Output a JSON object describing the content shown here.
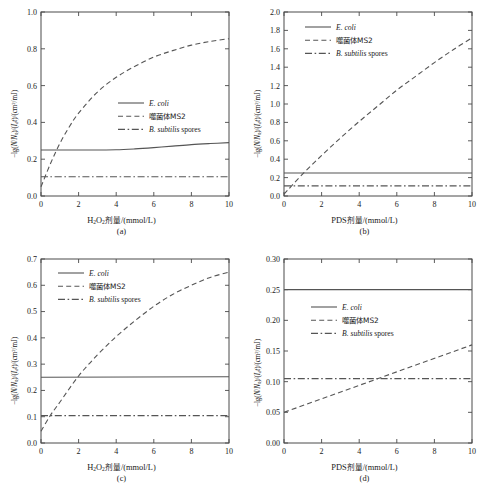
{
  "figure": {
    "ylabel_prefix": "−lg(",
    "series_names": {
      "ecoli": "E. coli",
      "ms2": "噬菌体MS2",
      "spores_italic": "B. subtilis",
      "spores_rest": " spores"
    }
  },
  "chart_data": [
    {
      "id": "a",
      "type": "line",
      "panel_label": "(a)",
      "title": "",
      "xlabel_cjk": "剂量",
      "xlabel_full": "H2O2剂量/(mmol/L)",
      "ylabel": "−lg(N/N0)/(Idt)/(cm2/mJ)",
      "xlim": [
        0,
        10
      ],
      "ylim": [
        0,
        1.0
      ],
      "xticks": [
        0,
        2,
        4,
        6,
        8,
        10
      ],
      "yticks": [
        0.0,
        0.2,
        0.4,
        0.6,
        0.8,
        1.0
      ],
      "ytick_labels": [
        "0.0",
        "0.2",
        "0.4",
        "0.6",
        "0.8",
        "1.0"
      ],
      "xtick_labels": [
        "0",
        "2",
        "4",
        "6",
        "8",
        "10"
      ],
      "grid": false,
      "legend_position": "center-right",
      "series": [
        {
          "name": "E. coli",
          "style": "solid",
          "x": [
            0,
            1,
            2,
            3,
            4,
            5,
            6,
            7,
            8,
            9,
            10
          ],
          "values": [
            0.25,
            0.25,
            0.25,
            0.25,
            0.251,
            0.256,
            0.263,
            0.271,
            0.279,
            0.285,
            0.29
          ]
        },
        {
          "name": "噬菌体MS2",
          "style": "dashed",
          "x": [
            0,
            0.5,
            1,
            1.5,
            2,
            3,
            4,
            5,
            6,
            7,
            8,
            9,
            10
          ],
          "values": [
            0.05,
            0.175,
            0.285,
            0.375,
            0.45,
            0.565,
            0.645,
            0.705,
            0.755,
            0.79,
            0.82,
            0.84,
            0.855
          ]
        },
        {
          "name": "B. subtilis spores",
          "style": "dashdot",
          "x": [
            0,
            2,
            4,
            6,
            8,
            10
          ],
          "values": [
            0.105,
            0.105,
            0.105,
            0.105,
            0.105,
            0.105
          ]
        }
      ]
    },
    {
      "id": "b",
      "type": "line",
      "panel_label": "(b)",
      "title": "",
      "xlabel_full": "PDS剂量/(mmol/L)",
      "ylabel": "−lg(N/N0)/(Idt)/(cm2/mJ)",
      "xlim": [
        0,
        10
      ],
      "ylim": [
        0,
        2.0
      ],
      "xticks": [
        0,
        2,
        4,
        6,
        8,
        10
      ],
      "yticks": [
        0.0,
        0.2,
        0.4,
        0.6,
        0.8,
        1.0,
        1.2,
        1.4,
        1.6,
        1.8,
        2.0
      ],
      "ytick_labels": [
        "0.0",
        "0.2",
        "0.4",
        "0.6",
        "0.8",
        "1.0",
        "1.2",
        "1.4",
        "1.6",
        "1.8",
        "2.0"
      ],
      "xtick_labels": [
        "0",
        "2",
        "4",
        "6",
        "8",
        "10"
      ],
      "grid": false,
      "legend_position": "top-left",
      "series": [
        {
          "name": "E. coli",
          "style": "solid",
          "x": [
            0,
            10
          ],
          "values": [
            0.25,
            0.25
          ]
        },
        {
          "name": "噬菌体MS2",
          "style": "dashed",
          "x": [
            0,
            1,
            2,
            3,
            4,
            5,
            6,
            7,
            8,
            9,
            10
          ],
          "values": [
            0.02,
            0.24,
            0.44,
            0.63,
            0.81,
            0.98,
            1.15,
            1.3,
            1.45,
            1.59,
            1.72
          ]
        },
        {
          "name": "B. subtilis spores",
          "style": "dashdot",
          "x": [
            0,
            10
          ],
          "values": [
            0.11,
            0.11
          ]
        }
      ]
    },
    {
      "id": "c",
      "type": "line",
      "panel_label": "(c)",
      "title": "",
      "xlabel_full": "H2O2剂量/(mmol/L)",
      "ylabel": "−lg(N/N0)/(Idt)/(cm2/mJ)",
      "xlim": [
        0,
        10
      ],
      "ylim": [
        0,
        0.7
      ],
      "xticks": [
        0,
        2,
        4,
        6,
        8,
        10
      ],
      "yticks": [
        0.0,
        0.1,
        0.2,
        0.3,
        0.4,
        0.5,
        0.6,
        0.7
      ],
      "ytick_labels": [
        "0.0",
        "0.1",
        "0.2",
        "0.3",
        "0.4",
        "0.5",
        "0.6",
        "0.7"
      ],
      "xtick_labels": [
        "0",
        "2",
        "4",
        "6",
        "8",
        "10"
      ],
      "grid": false,
      "legend_position": "top-left",
      "series": [
        {
          "name": "E. coli",
          "style": "solid",
          "x": [
            0,
            10
          ],
          "values": [
            0.25,
            0.252
          ]
        },
        {
          "name": "噬菌体MS2",
          "style": "dashed",
          "x": [
            0,
            0.5,
            1,
            2,
            3,
            4,
            5,
            6,
            7,
            8,
            9,
            10
          ],
          "values": [
            0.045,
            0.105,
            0.155,
            0.255,
            0.335,
            0.405,
            0.465,
            0.52,
            0.565,
            0.6,
            0.63,
            0.65
          ]
        },
        {
          "name": "B. subtilis spores",
          "style": "dashdot",
          "x": [
            0,
            10
          ],
          "values": [
            0.104,
            0.104
          ]
        }
      ]
    },
    {
      "id": "d",
      "type": "line",
      "panel_label": "(d)",
      "title": "",
      "xlabel_full": "PDS剂量/(mmol/L)",
      "ylabel": "−lg(N/N0)/(Idt)/(cm2/mJ)",
      "xlim": [
        0,
        10
      ],
      "ylim": [
        0,
        0.3
      ],
      "xticks": [
        0,
        2,
        4,
        6,
        8,
        10
      ],
      "yticks": [
        0.0,
        0.05,
        0.1,
        0.15,
        0.2,
        0.25,
        0.3
      ],
      "ytick_labels": [
        "0.00",
        "0.05",
        "0.10",
        "0.15",
        "0.20",
        "0.25",
        "0.30"
      ],
      "xtick_labels": [
        "0",
        "2",
        "4",
        "6",
        "8",
        "10"
      ],
      "grid": false,
      "legend_position": "center-left",
      "series": [
        {
          "name": "E. coli",
          "style": "solid",
          "x": [
            0,
            10
          ],
          "values": [
            0.25,
            0.25
          ]
        },
        {
          "name": "噬菌体MS2",
          "style": "dashed",
          "x": [
            0,
            10
          ],
          "values": [
            0.05,
            0.16
          ]
        },
        {
          "name": "B. subtilis spores",
          "style": "dashdot",
          "x": [
            0,
            10
          ],
          "values": [
            0.105,
            0.105
          ]
        }
      ]
    }
  ]
}
